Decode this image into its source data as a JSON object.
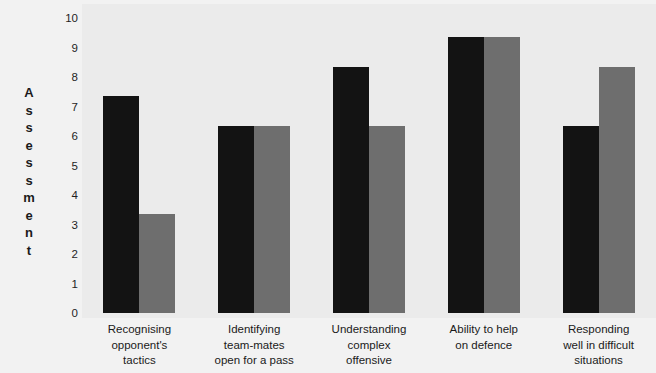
{
  "chart_data": {
    "type": "bar",
    "title": "",
    "subtitle": "",
    "xlabel": "",
    "ylabel": "Assessment",
    "ylim": [
      0,
      10
    ],
    "y_ticks": [
      10,
      9,
      8,
      7,
      6,
      5,
      4,
      3,
      2,
      1,
      0
    ],
    "grid": false,
    "legend": null,
    "legend_position": "none",
    "categories": [
      "Recognising opponent's tactics",
      "Identifying team-mates open for a pass",
      "Understanding complex offensive",
      "Ability to help on defence",
      "Responding well in difficult situations"
    ],
    "category_lines": [
      [
        "Recognising",
        "opponent's",
        "tactics"
      ],
      [
        "Identifying",
        "team-mates",
        "open for a pass"
      ],
      [
        "Understanding",
        "complex",
        "offensive"
      ],
      [
        "Ability to help",
        "on defence"
      ],
      [
        "Responding",
        "well in difficult",
        "situations"
      ]
    ],
    "series": [
      {
        "name": "Series 1",
        "color": "#131313",
        "values": [
          7.35,
          6.35,
          8.35,
          9.35,
          6.35
        ]
      },
      {
        "name": "Series 2",
        "color": "#6e6e6e",
        "values": [
          3.35,
          6.35,
          6.35,
          9.35,
          8.35
        ]
      }
    ]
  },
  "colors": {
    "series_a": "#131313",
    "series_b": "#6e6e6e",
    "plot_background": "#ebebeb",
    "figure_background": "#f2f2f2",
    "text": "#1a1a1a"
  },
  "axis": {
    "y_title_text": "A\ns\ns\ne\ns\ns\nm\ne\nn\nt"
  }
}
